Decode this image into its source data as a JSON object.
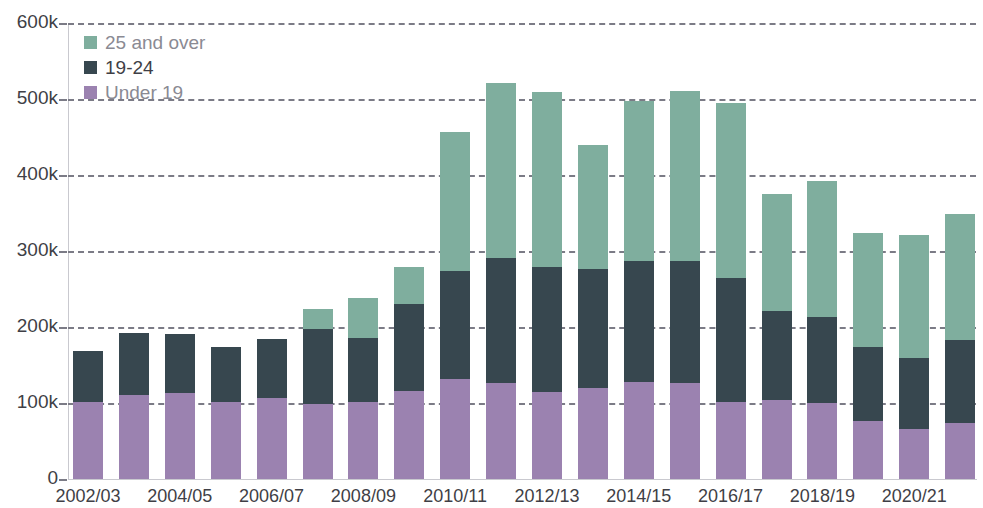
{
  "chart_data": {
    "type": "bar",
    "subtype": "stacked-bar",
    "title": "",
    "xlabel": "",
    "ylabel": "",
    "ylim": [
      0,
      600000
    ],
    "y_tick_values": [
      0,
      100000,
      200000,
      300000,
      400000,
      500000,
      600000
    ],
    "y_tick_labels": [
      "0",
      "100k",
      "200k",
      "300k",
      "400k",
      "500k",
      "600k"
    ],
    "grid": true,
    "grid_style": "dashed horizontal",
    "legend_position": "top-left",
    "categories": [
      "2002/03",
      "2003/04",
      "2004/05",
      "2005/06",
      "2006/07",
      "2007/08",
      "2008/09",
      "2009/10",
      "2010/11",
      "2011/12",
      "2012/13",
      "2013/14",
      "2014/15",
      "2015/16",
      "2016/17",
      "2017/18",
      "2018/19",
      "2019/20",
      "2020/21",
      "2021/22"
    ],
    "visible_tick_labels": [
      "2002/03",
      "2004/05",
      "2006/07",
      "2008/09",
      "2010/11",
      "2012/13",
      "2014/15",
      "2016/17",
      "2018/19",
      "2020/21"
    ],
    "series": [
      {
        "name": "Under 19",
        "color": "#9b82b0",
        "values": [
          101000,
          110000,
          113000,
          101000,
          107000,
          99000,
          101000,
          116000,
          132000,
          126000,
          115000,
          120000,
          128000,
          126000,
          101000,
          104000,
          100000,
          76000,
          66000,
          74000
        ]
      },
      {
        "name": "19-24",
        "color": "#37474f",
        "values": [
          67000,
          82000,
          78000,
          73000,
          77000,
          98000,
          85000,
          114000,
          142000,
          165000,
          164000,
          156000,
          159000,
          161000,
          163000,
          117000,
          113000,
          98000,
          93000,
          109000
        ]
      },
      {
        "name": "25 and over",
        "color": "#7fae9e",
        "values": [
          0,
          0,
          0,
          0,
          0,
          27000,
          52000,
          49000,
          182000,
          230000,
          230000,
          163000,
          210000,
          224000,
          231000,
          154000,
          179000,
          150000,
          162000,
          166000
        ]
      }
    ],
    "totals": [
      168000,
      192000,
      191000,
      174000,
      184000,
      224000,
      238000,
      279000,
      456000,
      521000,
      509000,
      439000,
      497000,
      511000,
      495000,
      375000,
      392000,
      324000,
      321000,
      349000
    ]
  },
  "legend": {
    "items": [
      {
        "label": "25 and over",
        "color": "#7fae9e"
      },
      {
        "label": "19-24",
        "color": "#37474f"
      },
      {
        "label": "Under 19",
        "color": "#9b82b0"
      }
    ]
  }
}
